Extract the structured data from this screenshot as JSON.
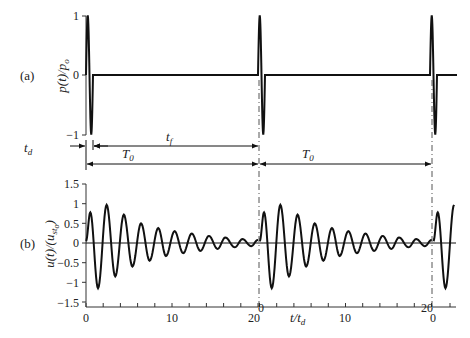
{
  "chart_data": [
    {
      "type": "line",
      "panel_label": "(a)",
      "ylabel": "p(t)/p_o",
      "ylabel_main": "p(t)/p",
      "ylabel_sub": "o",
      "yticks": [
        "1",
        "0",
        "−1"
      ],
      "ylim": [
        -1,
        1
      ],
      "description": "Periodic single-cycle sine pulse loading of duration t_d repeating every T_0 = 20 t_d",
      "series": [
        {
          "name": "p(t)/p_o",
          "pulse_shape": "one full sine cycle (+1 then -1) over t_d",
          "pulse_start_times_t_over_td": [
            0,
            20,
            40
          ],
          "value_between_pulses": 0
        }
      ]
    },
    {
      "type": "line",
      "panel_label": "(b)",
      "ylabel": "u(t)/(u_st)_o",
      "ylabel_main": "u(t)/(u",
      "ylabel_sub": "st",
      "ylabel_sub2": "o",
      "ylabel_close": ")",
      "xlabel": "t/t_d",
      "xlabel_main": "t/t",
      "xlabel_sub": "d",
      "yticks": [
        "1.5",
        "1",
        "0.5",
        "0",
        "−0.5",
        "−1",
        "−1.5"
      ],
      "ylim": [
        -1.5,
        1.5
      ],
      "xticks_segment1": [
        "0",
        "10",
        "20"
      ],
      "xticks_segment2": [
        "0",
        "10",
        "20"
      ],
      "xticks_segment3": [
        "0"
      ],
      "series": [
        {
          "name": "u(t)/(u_st)_o",
          "description": "damped free vibration after each pulse, period approx 2 t_d",
          "peak_times": [
            0.5,
            2.4,
            4.4,
            6.4,
            8.4,
            10.3,
            12.3,
            14.3,
            16.2,
            18.2
          ],
          "peak_values": [
            0.78,
            0.97,
            0.72,
            0.5,
            0.38,
            0.3,
            0.24,
            0.18,
            0.14,
            0.1
          ],
          "trough_times": [
            1.4,
            3.4,
            5.4,
            7.4,
            9.3,
            11.3,
            13.3,
            15.3,
            17.3,
            19.2
          ],
          "trough_values": [
            -1.15,
            -0.85,
            -0.6,
            -0.45,
            -0.33,
            -0.26,
            -0.2,
            -0.15,
            -0.11,
            -0.08
          ]
        }
      ]
    }
  ],
  "annotations": {
    "td": "t",
    "td_sub": "d",
    "tf": "t",
    "tf_sub": "f",
    "T0_first": "T",
    "T0_first_sub": "0",
    "T0_second": "T",
    "T0_second_sub": "0"
  }
}
